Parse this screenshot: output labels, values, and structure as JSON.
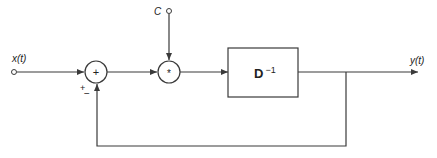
{
  "diagram": {
    "type": "block-diagram",
    "colors": {
      "stroke": "#3a3a3a",
      "background": "#ffffff",
      "text": "#222222"
    },
    "input": {
      "label": "x(t)"
    },
    "output": {
      "label": "y(t)"
    },
    "constant_input": {
      "label": "C"
    },
    "sum_junction": {
      "symbol": "+",
      "signs": {
        "plus": "+",
        "minus": "−"
      }
    },
    "multiply_junction": {
      "symbol": "*"
    },
    "block": {
      "label": "D",
      "superscript": "−1"
    },
    "connections": [
      "x(t) -> sum (+)",
      "feedback y(t) -> sum (−)",
      "sum -> multiply",
      "C -> multiply",
      "multiply -> D^-1",
      "D^-1 -> y(t)"
    ]
  }
}
